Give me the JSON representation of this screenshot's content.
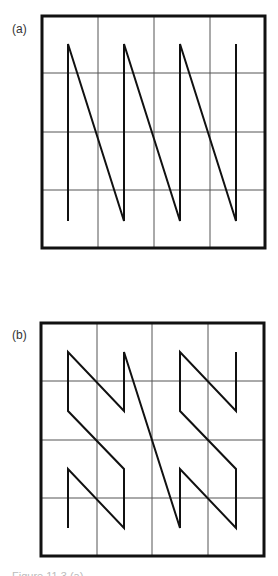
{
  "figure": {
    "panels": [
      {
        "label": "(a)",
        "curve": "row-major scan (N-order)",
        "grid": {
          "rows": 4,
          "cols": 4
        },
        "path": [
          [
            0,
            3
          ],
          [
            0,
            0
          ],
          [
            1,
            3
          ],
          [
            1,
            0
          ],
          [
            2,
            3
          ],
          [
            2,
            0
          ],
          [
            3,
            3
          ],
          [
            3,
            0
          ]
        ]
      },
      {
        "label": "(b)",
        "curve": "Z-order (Morton) curve",
        "grid": {
          "rows": 4,
          "cols": 4
        },
        "path": [
          [
            0,
            3
          ],
          [
            0,
            2
          ],
          [
            1,
            3
          ],
          [
            1,
            2
          ],
          [
            0,
            1
          ],
          [
            0,
            0
          ],
          [
            1,
            1
          ],
          [
            1,
            0
          ],
          [
            2,
            3
          ],
          [
            2,
            2
          ],
          [
            3,
            3
          ],
          [
            3,
            2
          ],
          [
            2,
            1
          ],
          [
            2,
            0
          ],
          [
            3,
            1
          ],
          [
            3,
            0
          ]
        ]
      }
    ],
    "caption": "Figure 11.3 (a) ..."
  }
}
